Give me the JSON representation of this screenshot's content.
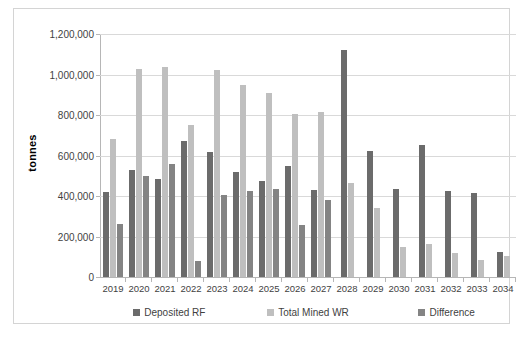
{
  "chart_data": {
    "type": "bar",
    "title": "",
    "subtitle": "",
    "xlabel": "",
    "ylabel": "tonnes",
    "ylim": [
      0,
      1200000
    ],
    "ytick_values": [
      0,
      200000,
      400000,
      600000,
      800000,
      1000000,
      1200000
    ],
    "ytick_labels": [
      "0",
      "200,000",
      "400,000",
      "600,000",
      "800,000",
      "1,000,000",
      "1,200,000"
    ],
    "grid": true,
    "legend_position": "bottom",
    "categories": [
      "2019",
      "2020",
      "2021",
      "2022",
      "2023",
      "2024",
      "2025",
      "2026",
      "2027",
      "2028",
      "2029",
      "2030",
      "2031",
      "2032",
      "2033",
      "2034"
    ],
    "series": [
      {
        "name": "Deposited RF",
        "color": "#6b6b6b",
        "values": [
          420000,
          530000,
          482000,
          672000,
          615000,
          520000,
          475000,
          548000,
          430000,
          1122000,
          622000,
          437000,
          653000,
          423000,
          413000,
          123000
        ]
      },
      {
        "name": "Total Mined WR",
        "color": "#bfbfbf",
        "values": [
          680000,
          1025000,
          1037000,
          750000,
          1022000,
          948000,
          910000,
          803000,
          815000,
          465000,
          340000,
          148000,
          163000,
          118000,
          82000,
          103000
        ]
      },
      {
        "name": "Difference",
        "color": "#848484",
        "values": [
          260000,
          497000,
          557000,
          78000,
          407000,
          424000,
          435000,
          255000,
          382000,
          null,
          null,
          null,
          null,
          null,
          null,
          null
        ]
      }
    ]
  },
  "legend": {
    "items": [
      {
        "label": "Deposited RF",
        "color": "#6b6b6b"
      },
      {
        "label": "Total Mined WR",
        "color": "#bfbfbf"
      },
      {
        "label": "Difference",
        "color": "#848484"
      }
    ]
  },
  "colors": {
    "grid": "#d9d9d9",
    "axis": "#b6b6b6",
    "frame": "#d4d4d4",
    "text": "#3f3f3f",
    "background": "#ffffff"
  }
}
